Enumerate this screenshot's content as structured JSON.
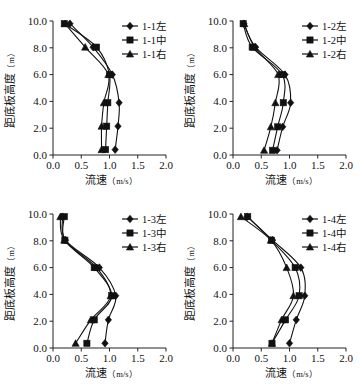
{
  "figure": {
    "panel_count": 4,
    "x_axis": {
      "label": "流速",
      "unit": "（m/s）",
      "ticks": [
        "0.0",
        "0.5",
        "1.0",
        "1.5",
        "2.0"
      ],
      "min": 0.0,
      "max": 2.0
    },
    "y_axis": {
      "label": "距底板高度",
      "unit": "（m）",
      "ticks": [
        "0.0",
        "2.0",
        "4.0",
        "6.0",
        "8.0",
        "10.0"
      ],
      "min": 0.0,
      "max": 10.0
    },
    "marker_shapes": {
      "left": "diamond",
      "middle": "square",
      "right": "triangle"
    },
    "colors": {
      "ink": "#111111",
      "axis": "#222222",
      "background": "#ffffff"
    }
  },
  "chart_data": [
    {
      "type": "line",
      "title": "1-1",
      "xlabel": "流速（m/s）",
      "ylabel": "距底板高度（m）",
      "xlim": [
        0.0,
        2.0
      ],
      "ylim": [
        0.0,
        10.0
      ],
      "xticks": [
        0.0,
        0.5,
        1.0,
        1.5,
        2.0
      ],
      "yticks": [
        0.0,
        2.0,
        4.0,
        6.0,
        8.0,
        10.0
      ],
      "grid": false,
      "legend_position": "top-right",
      "orientation": "x=velocity, y=height",
      "y": [
        0.4,
        2.15,
        3.9,
        6.0,
        8.05,
        9.8
      ],
      "series": [
        {
          "name": "1-1左",
          "marker": "diamond",
          "values": [
            1.1,
            1.15,
            1.17,
            1.05,
            0.71,
            0.3
          ]
        },
        {
          "name": "1-1中",
          "marker": "square",
          "values": [
            0.93,
            0.95,
            0.97,
            1.0,
            0.77,
            0.2
          ]
        },
        {
          "name": "1-1右",
          "marker": "triangle",
          "values": [
            0.86,
            0.86,
            0.9,
            0.98,
            0.57,
            0.21
          ]
        }
      ]
    },
    {
      "type": "line",
      "title": "1-2",
      "xlabel": "流速（m/s）",
      "ylabel": "距底板高度（m）",
      "xlim": [
        0.0,
        2.0
      ],
      "ylim": [
        0.0,
        10.0
      ],
      "xticks": [
        0.0,
        0.5,
        1.0,
        1.5,
        2.0
      ],
      "yticks": [
        0.0,
        2.0,
        4.0,
        6.0,
        8.0,
        10.0
      ],
      "grid": false,
      "legend_position": "top-right",
      "orientation": "x=velocity, y=height",
      "y": [
        0.35,
        2.1,
        3.9,
        6.0,
        8.05,
        9.8
      ],
      "series": [
        {
          "name": "1-2左",
          "marker": "diamond",
          "values": [
            0.78,
            0.88,
            1.02,
            0.92,
            0.4,
            0.19
          ]
        },
        {
          "name": "1-2中",
          "marker": "square",
          "values": [
            0.7,
            0.79,
            0.89,
            0.87,
            0.34,
            0.18
          ]
        },
        {
          "name": "1-2右",
          "marker": "triangle",
          "values": [
            0.55,
            0.67,
            0.75,
            0.8,
            0.38,
            0.2
          ]
        }
      ]
    },
    {
      "type": "line",
      "title": "1-3",
      "xlabel": "流速（m/s）",
      "ylabel": "距底板高度（m）",
      "xlim": [
        0.0,
        2.0
      ],
      "ylim": [
        0.0,
        10.0
      ],
      "xticks": [
        0.0,
        0.5,
        1.0,
        1.5,
        2.0
      ],
      "yticks": [
        0.0,
        2.0,
        4.0,
        6.0,
        8.0,
        10.0
      ],
      "grid": false,
      "legend_position": "top-right",
      "orientation": "x=velocity, y=height",
      "y": [
        0.35,
        2.1,
        3.9,
        6.0,
        8.05,
        9.8
      ],
      "series": [
        {
          "name": "1-3左",
          "marker": "diamond",
          "values": [
            0.92,
            0.98,
            1.11,
            0.82,
            0.22,
            0.17
          ]
        },
        {
          "name": "1-3中",
          "marker": "square",
          "values": [
            0.6,
            0.73,
            1.04,
            0.73,
            0.21,
            0.2
          ]
        },
        {
          "name": "1-3右",
          "marker": "triangle",
          "values": [
            0.4,
            0.67,
            1.02,
            0.77,
            0.2,
            0.13
          ]
        }
      ]
    },
    {
      "type": "line",
      "title": "1-4",
      "xlabel": "流速（m/s）",
      "ylabel": "距底板高度（m）",
      "xlim": [
        0.0,
        2.0
      ],
      "ylim": [
        0.0,
        10.0
      ],
      "xticks": [
        0.0,
        0.5,
        1.0,
        1.5,
        2.0
      ],
      "yticks": [
        0.0,
        2.0,
        4.0,
        6.0,
        8.0,
        10.0
      ],
      "grid": false,
      "legend_position": "top-right",
      "orientation": "x=velocity, y=height",
      "y": [
        0.35,
        2.1,
        3.9,
        6.0,
        8.05,
        9.8
      ],
      "series": [
        {
          "name": "1-4左",
          "marker": "diamond",
          "values": [
            1.0,
            1.12,
            1.27,
            1.2,
            0.7,
            0.25
          ]
        },
        {
          "name": "1-4中",
          "marker": "square",
          "values": [
            0.69,
            0.93,
            1.17,
            1.1,
            0.68,
            0.26
          ]
        },
        {
          "name": "1-4右",
          "marker": "triangle",
          "values": [
            0.69,
            0.86,
            1.07,
            0.95,
            0.67,
            0.14
          ]
        }
      ]
    }
  ]
}
